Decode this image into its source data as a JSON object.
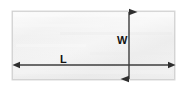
{
  "figure": {
    "type": "geometry-dimension-diagram",
    "background_color": "#ffffff"
  },
  "shape": {
    "name": "rectangle",
    "fill_color": "#f0f0f0",
    "fill_color_light": "#fafafa",
    "border_color": "#d8d8d8",
    "x": 12,
    "y": 11,
    "width": 163,
    "height": 69
  },
  "dimensions": [
    {
      "id": "length",
      "label": "L",
      "orientation": "horizontal",
      "arrow_color": "#3c3c3c",
      "label_color": "#121212",
      "line": {
        "x1": 13,
        "y1": 65,
        "x2": 175,
        "y2": 65
      },
      "label_position": {
        "x": 60,
        "y": 54
      }
    },
    {
      "id": "width",
      "label": "W",
      "orientation": "vertical",
      "arrow_color": "#3c3c3c",
      "label_color": "#121212",
      "line": {
        "x1": 129,
        "y1": 5,
        "x2": 129,
        "y2": 86
      },
      "label_position": {
        "x": 117,
        "y": 35
      }
    }
  ]
}
